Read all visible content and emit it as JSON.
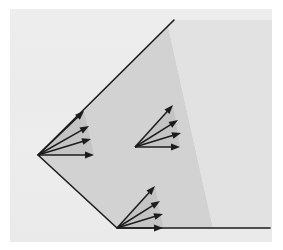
{
  "figure": {
    "width": 283,
    "height": 250
  },
  "canvas": {
    "outer_background": "#ffffff",
    "plate_background": "#ececec",
    "plate": {
      "x": 10,
      "y": 9,
      "width": 262,
      "height": 233
    }
  },
  "colors": {
    "background": "#ececec",
    "wedge_fill": "#d2d2d2",
    "wedge_fill_light": "#e2e2e2",
    "stroke": "#1c1c1c",
    "arrow": "#1c1c1c",
    "fan_fill": "#c4c4c4"
  },
  "geometry": {
    "left_vertex": {
      "x": 38,
      "y": 155,
      "label": "left-vertex"
    },
    "bottom_vertex": {
      "x": 117,
      "y": 228,
      "label": "bottom-vertex"
    },
    "upper_ray_end": {
      "x": 174,
      "y": 20,
      "label": "upper-ray-end"
    },
    "lower_ray_end": {
      "x": 270,
      "y": 228,
      "label": "lower-ray-end"
    },
    "shade_boundary_top": {
      "x": 168,
      "y": 26
    },
    "shade_boundary_bottom": {
      "x": 213,
      "y": 228
    },
    "stroke_width": 1.6
  },
  "fans": [
    {
      "name": "left-fan",
      "origin": {
        "x": 38,
        "y": 155
      },
      "arrow_count": 4,
      "arrows": [
        {
          "index": 0,
          "tip": {
            "x": 84,
            "y": 111
          },
          "angle_deg": 44
        },
        {
          "index": 1,
          "tip": {
            "x": 89,
            "y": 126
          },
          "angle_deg": 30
        },
        {
          "index": 2,
          "tip": {
            "x": 91,
            "y": 139
          },
          "angle_deg": 17
        },
        {
          "index": 3,
          "tip": {
            "x": 94,
            "y": 155
          },
          "angle_deg": 0
        }
      ]
    },
    {
      "name": "middle-fan",
      "origin": {
        "x": 135,
        "y": 147
      },
      "arrow_count": 4,
      "arrows": [
        {
          "index": 0,
          "tip": {
            "x": 173,
            "y": 105
          },
          "angle_deg": 48
        },
        {
          "index": 1,
          "tip": {
            "x": 178,
            "y": 120
          },
          "angle_deg": 32
        },
        {
          "index": 2,
          "tip": {
            "x": 181,
            "y": 133
          },
          "angle_deg": 17
        },
        {
          "index": 3,
          "tip": {
            "x": 180,
            "y": 147
          },
          "angle_deg": 0
        }
      ]
    },
    {
      "name": "bottom-fan",
      "origin": {
        "x": 117,
        "y": 228
      },
      "arrow_count": 4,
      "arrows": [
        {
          "index": 0,
          "tip": {
            "x": 155,
            "y": 186
          },
          "angle_deg": 48
        },
        {
          "index": 1,
          "tip": {
            "x": 160,
            "y": 201
          },
          "angle_deg": 32
        },
        {
          "index": 2,
          "tip": {
            "x": 163,
            "y": 214
          },
          "angle_deg": 17
        },
        {
          "index": 3,
          "tip": {
            "x": 163,
            "y": 228
          },
          "angle_deg": 0
        }
      ]
    }
  ],
  "arrow_head": {
    "length": 9,
    "half_width": 3.4
  }
}
